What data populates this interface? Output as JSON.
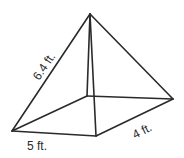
{
  "figure": {
    "type": "rectangular pyramid",
    "labels": {
      "slant_edge": "6.4 ft.",
      "base_length": "5 ft.",
      "base_width": "4 ft."
    },
    "vertices": {
      "apex": [
        90,
        14
      ],
      "front_left": [
        12,
        131
      ],
      "front_right": [
        96,
        136
      ],
      "back_right": [
        173,
        99
      ],
      "back_left": [
        87,
        96
      ]
    },
    "colors": {
      "line": "#2a2a2a",
      "background": "#ffffff"
    }
  }
}
